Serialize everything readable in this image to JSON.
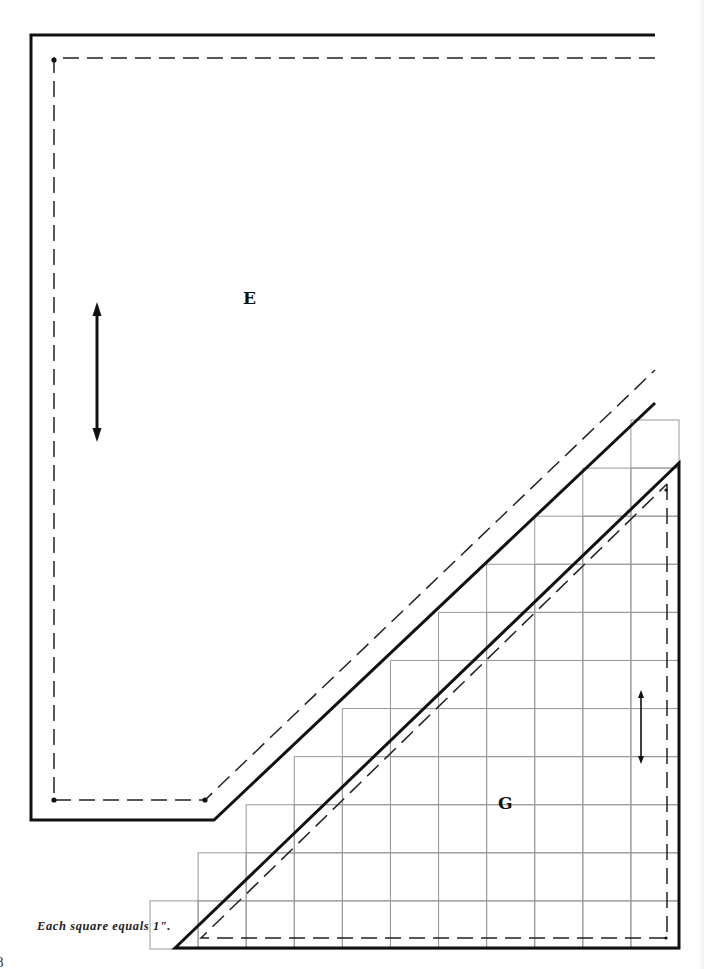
{
  "pattern": {
    "pieces": [
      {
        "id": "E",
        "label": "E"
      },
      {
        "id": "G",
        "label": "G"
      }
    ],
    "caption": "Each square equals 1\".",
    "page_number": "8",
    "grid_unit": "1 inch",
    "icons": {
      "grainline_e": "grainline-double-arrow-icon",
      "grainline_g": "grainline-double-arrow-icon"
    }
  }
}
